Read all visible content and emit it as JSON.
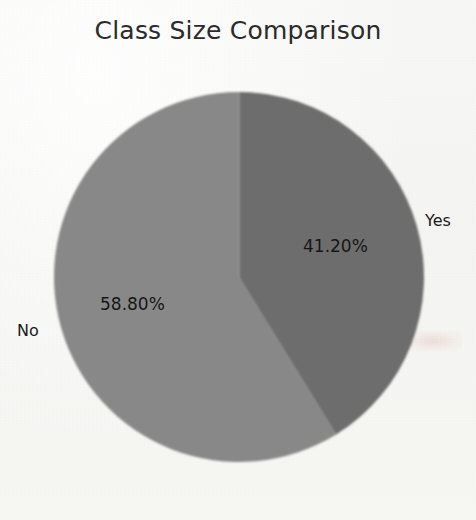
{
  "chart_data": {
    "type": "pie",
    "title": "Class Size Comparison",
    "categories": [
      "Yes",
      "No"
    ],
    "values": [
      41.2,
      58.8
    ],
    "value_labels": [
      "41.20%",
      "58.80%"
    ],
    "units": "percent",
    "start_angle_deg": 0,
    "direction": "clockwise",
    "legend": "none",
    "labels_position": "outside-category-inside-value",
    "slice_colors": [
      "#6d6d6d",
      "#888888"
    ],
    "series": [
      {
        "name": "Class Size Comparison",
        "values": [
          41.2,
          58.8
        ]
      }
    ],
    "slices": [
      {
        "label": "Yes",
        "value": 41.2,
        "value_label": "41.20%",
        "color": "#6d6d6d",
        "sweep_deg": 148.32
      },
      {
        "label": "No",
        "value": 58.8,
        "value_label": "58.80%",
        "color": "#888888",
        "sweep_deg": 211.68
      }
    ],
    "background_color": "#f6f6f4",
    "title_color": "#2b2b2b",
    "label_color": "#1a1a1a"
  },
  "figure": {
    "title": "Class Size Comparison",
    "pie": {
      "center_x": 239,
      "center_y": 277,
      "radius": 185
    },
    "slice_yes": {
      "name": "Yes",
      "value_label": "41.20%",
      "color": "#6d6d6d"
    },
    "slice_no": {
      "name": "No",
      "value_label": "58.80%",
      "color": "#888888"
    }
  }
}
